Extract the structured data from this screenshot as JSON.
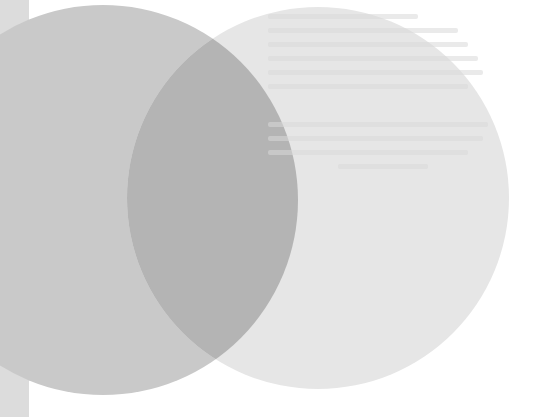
{
  "canvas": {
    "width": 538,
    "height": 417,
    "background": "#ffffff"
  },
  "left_strip": {
    "x": 0,
    "width": 29,
    "color": "#dcdcdc"
  },
  "circles": [
    {
      "name": "left-circle",
      "cx": 103,
      "cy": 200,
      "r": 195,
      "color": "#c9c9c9"
    },
    {
      "name": "right-circle",
      "cx": 318,
      "cy": 198,
      "r": 191,
      "color": "#e6e6e6"
    }
  ],
  "overlap": {
    "color": "#b4b4b4"
  },
  "ghost_text": {
    "legible": false,
    "lines": [
      {
        "x": 0,
        "y": 0,
        "w": 150
      },
      {
        "x": 0,
        "y": 14,
        "w": 190
      },
      {
        "x": 0,
        "y": 28,
        "w": 200
      },
      {
        "x": 0,
        "y": 42,
        "w": 210
      },
      {
        "x": 0,
        "y": 56,
        "w": 215
      },
      {
        "x": 0,
        "y": 70,
        "w": 200
      },
      {
        "x": 0,
        "y": 108,
        "w": 220
      },
      {
        "x": 0,
        "y": 122,
        "w": 215
      },
      {
        "x": 0,
        "y": 136,
        "w": 200
      },
      {
        "x": 70,
        "y": 150,
        "w": 90
      }
    ]
  }
}
